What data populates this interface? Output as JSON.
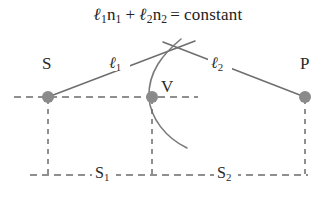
{
  "figure": {
    "type": "optics-ray-diagram",
    "caption_equation": {
      "full_text": "ℓ1n1 + ℓ2n2 = constant",
      "term1_symbol": "ℓ",
      "term1_sub": "1",
      "term1_index": "n",
      "term1_index_sub": "1",
      "operator": "+",
      "term2_symbol": "ℓ",
      "term2_sub": "2",
      "term2_index": "n",
      "term2_index_sub": "2",
      "equals": "=",
      "right_side": "constant"
    },
    "points": [
      {
        "id": "S",
        "label": "S",
        "x": 48,
        "y": 97,
        "label_x": 42,
        "label_y": 55
      },
      {
        "id": "V",
        "label": "V",
        "x": 152,
        "y": 97,
        "label_x": 162,
        "label_y": 78
      },
      {
        "id": "P",
        "label": "P",
        "x": 305,
        "y": 97,
        "label_x": 300,
        "label_y": 55
      }
    ],
    "ray_labels": [
      {
        "id": "l1",
        "symbol": "ℓ",
        "sub": "1",
        "x": 110,
        "y": 58
      },
      {
        "id": "l2",
        "symbol": "ℓ",
        "sub": "2",
        "x": 212,
        "y": 58
      }
    ],
    "baseline_labels": [
      {
        "id": "s1",
        "symbol": "S",
        "sub": "1",
        "x": 96,
        "y": 165
      },
      {
        "id": "s2",
        "symbol": "S",
        "sub": "2",
        "x": 218,
        "y": 165
      }
    ],
    "colors": {
      "dot": "#8a8a8a",
      "ray_line": "#6e6e6e",
      "dashed_line": "#6b6b6b",
      "curve": "#7a7a7a",
      "text": "#2a2a2a",
      "background": "#ffffff"
    },
    "geometry": {
      "axis_y": 97,
      "axis_dash_x_start": 14,
      "axis_dash_x_end": 198,
      "baseline_y": 175,
      "baseline_x_start": 30,
      "baseline_x_end": 308,
      "crossing_point": {
        "x": 179,
        "y": 48
      },
      "ray1_start": {
        "x": 48,
        "y": 97
      },
      "ray1_end": {
        "x": 195,
        "y": 41
      },
      "ray2_start": {
        "x": 163,
        "y": 42
      },
      "ray2_end": {
        "x": 305,
        "y": 97
      },
      "interface_curve": {
        "top": {
          "x": 180,
          "y": 40
        },
        "through": {
          "x": 152,
          "y": 97
        },
        "bottom": {
          "x": 186,
          "y": 148
        }
      }
    }
  }
}
